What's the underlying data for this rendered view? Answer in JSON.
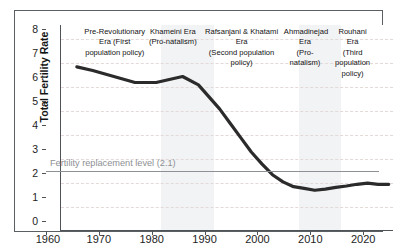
{
  "chart_data": {
    "type": "line",
    "title": "",
    "subtitle": "",
    "xlabel": "",
    "ylabel": "Total Fertility Rate",
    "xlim": [
      1960,
      2023
    ],
    "ylim": [
      0,
      8.6
    ],
    "grid": true,
    "legend_position": "none",
    "x_ticks": [
      "1960",
      "1970",
      "1980",
      "1990",
      "2000",
      "2010",
      "2020"
    ],
    "x_tick_values": [
      1960,
      1970,
      1980,
      1990,
      2000,
      2010,
      2020
    ],
    "y_ticks": [
      "0",
      "1",
      "2",
      "3",
      "4",
      "5",
      "6",
      "7",
      "8"
    ],
    "y_tick_values": [
      0,
      1,
      2,
      3,
      4,
      5,
      6,
      7,
      8
    ],
    "series": [
      {
        "name": "Total Fertility Rate",
        "color": "#2b2b2b",
        "x": [
          1963,
          1966,
          1970,
          1974,
          1978,
          1983,
          1986,
          1988,
          1990,
          1992,
          1994,
          1996,
          1998,
          2000,
          2002,
          2004,
          2006,
          2008,
          2010,
          2012,
          2014,
          2016,
          2018,
          2020,
          2022
        ],
        "values": [
          6.85,
          6.7,
          6.45,
          6.2,
          6.2,
          6.45,
          6.1,
          5.6,
          5.1,
          4.5,
          3.9,
          3.3,
          2.8,
          2.35,
          2.05,
          1.85,
          1.78,
          1.7,
          1.75,
          1.82,
          1.88,
          1.95,
          2.0,
          1.95,
          1.95
        ]
      }
    ],
    "annotations": {
      "replacement_level": {
        "label": "Fertility replacement level (2.1)",
        "value": 2.1,
        "color": "#8d9094"
      }
    },
    "eras": [
      {
        "name": "Pre-Revolutionary Era (First population policy)",
        "lines": [
          "Pre-Revolutionary",
          "Era (First",
          "population policy)"
        ],
        "start": 1967,
        "end": 1979,
        "shaded": false
      },
      {
        "name": "Khameini Era (Pro-natalism)",
        "lines": [
          "Khameini Era",
          "(Pro-natalism)"
        ],
        "start": 1979,
        "end": 1989,
        "shaded": true
      },
      {
        "name": "Rafsanjani & Khatami Era (Second population policy)",
        "lines": [
          "Rafsanjani & Khatami Era",
          "(Second population policy)"
        ],
        "start": 1989,
        "end": 2005,
        "shaded": false
      },
      {
        "name": "Ahmadinejad Era (Pro-natalism)",
        "lines": [
          "Ahmadinejad",
          "Era",
          "(Pro-natalism)"
        ],
        "start": 2005,
        "end": 2013,
        "shaded": true
      },
      {
        "name": "Rouhani Era (Third population policy)",
        "lines": [
          "Rouhani",
          "Era",
          "(Third",
          "population",
          "policy)"
        ],
        "start": 2013,
        "end": 2023,
        "shaded": false
      }
    ]
  },
  "axes": {
    "y_title": "Total Fertility Rate",
    "y_labels": [
      "8",
      "7",
      "6",
      "5",
      "4",
      "3",
      "2",
      "1",
      "0"
    ],
    "x_labels": [
      "1960",
      "1970",
      "1980",
      "1990",
      "2000",
      "2010",
      "2020"
    ]
  },
  "replacement": {
    "label": "Fertility replacement level (2.1)"
  },
  "era_labels": {
    "pre_revolutionary": "Pre-Revolutionary Era (First population policy)",
    "khameini": "Khameini Era (Pro-natalism)",
    "rafsanjani_khatami": "Rafsanjani & Khatami Era (Second population policy)",
    "ahmadinejad": "Ahmadinejad Era (Pro-natalism)",
    "rouhani": "Rouhani Era (Third population policy)"
  },
  "colors": {
    "series_line": "#2b2b2b",
    "replacement_line": "#8d9094",
    "gridline": "#e3d9d9",
    "band": "#f2f3f5",
    "frame": "#5a5f63"
  }
}
